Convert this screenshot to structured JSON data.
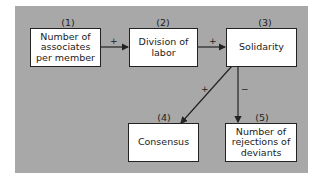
{
  "diagram": {
    "nodes": [
      {
        "id": 1,
        "number": "(1)",
        "label": "Number of associates per member"
      },
      {
        "id": 2,
        "number": "(2)",
        "label": "Division of labor"
      },
      {
        "id": 3,
        "number": "(3)",
        "label": "Solidarity"
      },
      {
        "id": 4,
        "number": "(4)",
        "label": "Consensus"
      },
      {
        "id": 5,
        "number": "(5)",
        "label": "Number of rejections of deviants"
      }
    ],
    "edges": [
      {
        "from": 1,
        "to": 2,
        "sign": "+"
      },
      {
        "from": 2,
        "to": 3,
        "sign": "+"
      },
      {
        "from": 3,
        "to": 4,
        "sign": "+"
      },
      {
        "from": 3,
        "to": 5,
        "sign": "−"
      }
    ],
    "colors": {
      "panel": "#a8a8a8",
      "box": "#ffffff",
      "ink": "#222222"
    }
  }
}
